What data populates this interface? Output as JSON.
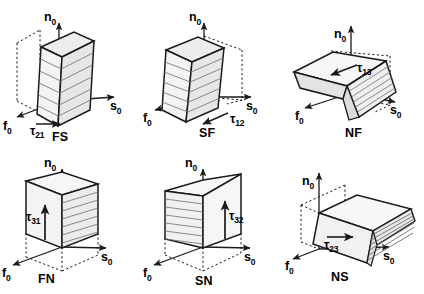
{
  "figure": {
    "axes": {
      "normal": "n",
      "fiber": "f",
      "sheet": "s",
      "subscript": "0"
    },
    "colors": {
      "stroke": "#1a1a1a",
      "dashed": "#1a1a1a",
      "face_light": "#f2f2f2",
      "face_mid": "#e4e4e4",
      "face_dark": "#d2d2d2",
      "hatch": "#6b6b6b",
      "text": "#000000"
    },
    "panels": [
      {
        "id": "fs",
        "mode_label": "FS",
        "tau_label": "τ",
        "tau_sub": "21",
        "tau_arrow_direction": "right",
        "axis_n": "n",
        "axis_n_sub": "0",
        "axis_f": "f",
        "axis_f_sub": "0",
        "axis_s": "s",
        "axis_s_sub": "0",
        "shape": "upright-block-sheared-toward-s",
        "hatch_face": "front",
        "hatch_orientation": "horizontal"
      },
      {
        "id": "sf",
        "mode_label": "SF",
        "tau_label": "τ",
        "tau_sub": "12",
        "tau_arrow_direction": "left-down",
        "axis_n": "n",
        "axis_n_sub": "0",
        "axis_f": "f",
        "axis_f_sub": "0",
        "axis_s": "s",
        "axis_s_sub": "0",
        "shape": "upright-block-sheared-toward-f",
        "hatch_face": "front-right",
        "hatch_orientation": "horizontal"
      },
      {
        "id": "nf",
        "mode_label": "NF",
        "tau_label": "τ",
        "tau_sub": "13",
        "tau_arrow_direction": "left",
        "axis_n": "n",
        "axis_n_sub": "0",
        "axis_f": "f",
        "axis_f_sub": "0",
        "axis_s": "s",
        "axis_s_sub": "0",
        "shape": "flat-slab-tilted-about-s",
        "hatch_face": "front-lower",
        "hatch_orientation": "diagonal"
      },
      {
        "id": "fn",
        "mode_label": "FN",
        "tau_label": "τ",
        "tau_sub": "31",
        "tau_arrow_direction": "up",
        "axis_n": "n",
        "axis_n_sub": "0",
        "axis_f": "f",
        "axis_f_sub": "0",
        "axis_s": "s",
        "axis_s_sub": "0",
        "shape": "wide-slab-along-s-sheared-up",
        "hatch_face": "right",
        "hatch_orientation": "horizontal"
      },
      {
        "id": "sn",
        "mode_label": "SN",
        "tau_label": "τ",
        "tau_sub": "32",
        "tau_arrow_direction": "up",
        "axis_n": "n",
        "axis_n_sub": "0",
        "axis_f": "f",
        "axis_f_sub": "0",
        "axis_s": "s",
        "axis_s_sub": "0",
        "shape": "wide-slab-along-s-sheared-up-left",
        "hatch_face": "left",
        "hatch_orientation": "horizontal"
      },
      {
        "id": "ns",
        "mode_label": "NS",
        "tau_label": "τ",
        "tau_sub": "23",
        "tau_arrow_direction": "right",
        "axis_n": "n",
        "axis_n_sub": "0",
        "axis_f": "f",
        "axis_f_sub": "0",
        "axis_s": "s",
        "axis_s_sub": "0",
        "shape": "flat-slab-tilted-about-f",
        "hatch_face": "right-lower",
        "hatch_orientation": "diagonal"
      }
    ]
  }
}
